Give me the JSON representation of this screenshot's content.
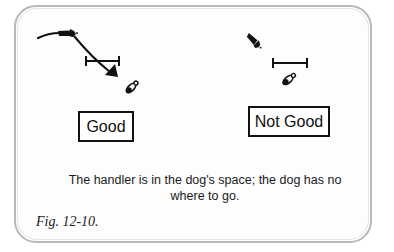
{
  "figure": {
    "label": "Fig. 12-10.",
    "caption": "The handler is in the dog's space; the dog has no where to go."
  },
  "panels": [
    {
      "id": "good",
      "label": "Good",
      "icons": [
        "handler-icon",
        "movement-arrow-icon",
        "distance-bar-icon",
        "dog-icon"
      ]
    },
    {
      "id": "not-good",
      "label": "Not Good",
      "icons": [
        "handler-icon",
        "distance-bar-icon",
        "dog-icon"
      ]
    }
  ],
  "colors": {
    "ink": "#111111",
    "frame_border": "#b8b8b8",
    "background": "#fdfdfd"
  }
}
